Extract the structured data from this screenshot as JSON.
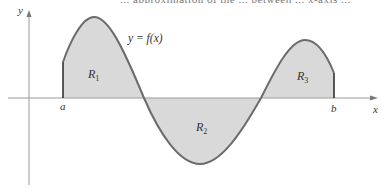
{
  "figure": {
    "top_caption_partial": "... approximation of the ... between ... x-axis ...",
    "axis_labels": {
      "x": "x",
      "y": "y"
    },
    "curve_label": "y = f(x)",
    "interval": {
      "left": "a",
      "right": "b"
    },
    "regions": [
      {
        "label": "R",
        "subscript": "1",
        "sign": "positive"
      },
      {
        "label": "R",
        "subscript": "2",
        "sign": "negative"
      },
      {
        "label": "R",
        "subscript": "3",
        "sign": "positive"
      }
    ],
    "colors": {
      "region_fill": "#d9d9d9",
      "curve_stroke": "#6b6b6b",
      "axis_stroke": "#9a9a9a",
      "boundary_stroke": "#333333"
    }
  }
}
